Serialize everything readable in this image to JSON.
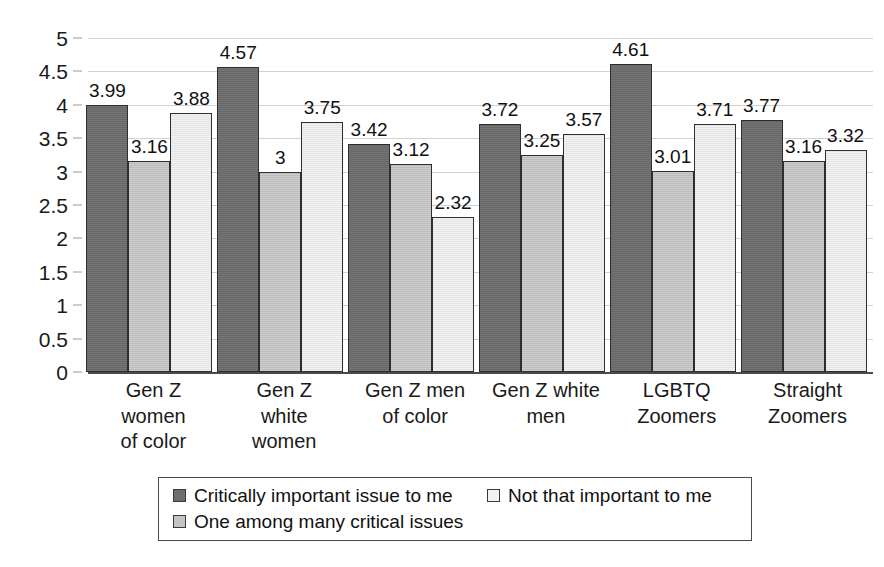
{
  "chart_data": {
    "type": "bar",
    "title": "",
    "subtitle": "",
    "xlabel": "",
    "ylabel": "",
    "ylim": [
      0,
      5
    ],
    "ytick_step": 0.5,
    "yticks": [
      "5",
      "4.5",
      "4",
      "3.5",
      "3",
      "2.5",
      "2",
      "1.5",
      "1",
      "0.5",
      "0"
    ],
    "grid": true,
    "legend_position": "bottom",
    "categories": [
      "Gen Z\nwomen\nof color",
      "Gen Z\nwhite\nwomen",
      "Gen Z men\nof color",
      "Gen Z white\nmen",
      "LGBTQ\nZoomers",
      "Straight\nZoomers"
    ],
    "category_labels": [
      "Gen Z women of color",
      "Gen Z white women",
      "Gen Z men of color",
      "Gen Z white men",
      "LGBTQ Zoomers",
      "Straight Zoomers"
    ],
    "series": [
      {
        "name": "Critically important issue to me",
        "color": "#6d6d6d",
        "values": [
          3.99,
          4.57,
          3.42,
          3.72,
          4.61,
          3.77
        ],
        "labels": [
          "3.99",
          "4.57",
          "3.42",
          "3.72",
          "4.61",
          "3.77"
        ]
      },
      {
        "name": "One among many critical issues",
        "color": "#c4c4c4",
        "values": [
          3.16,
          3.0,
          3.12,
          3.25,
          3.01,
          3.16
        ],
        "labels": [
          "3.16",
          "3",
          "3.12",
          "3.25",
          "3.01",
          "3.16"
        ]
      },
      {
        "name": "Not that important to me",
        "color": "#f3f3f3",
        "values": [
          3.88,
          3.75,
          2.32,
          3.57,
          3.71,
          3.32
        ],
        "labels": [
          "3.88",
          "3.75",
          "2.32",
          "3.57",
          "3.71",
          "3.32"
        ]
      }
    ]
  },
  "legend": {
    "items": [
      {
        "label": "Critically important issue to me",
        "swatch": "dark-gray-swatch"
      },
      {
        "label": "One among many critical issues",
        "swatch": "medium-gray-swatch"
      },
      {
        "label": "Not that important to me",
        "swatch": "light-gray-swatch"
      }
    ]
  }
}
